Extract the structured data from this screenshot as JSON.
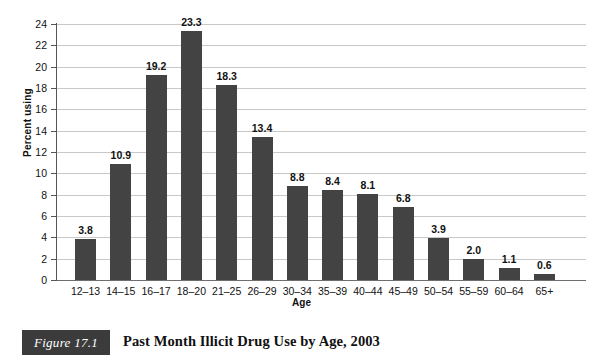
{
  "figure": {
    "badge_label": "Figure 17.1",
    "caption": "Past Month Illicit Drug Use by Age, 2003"
  },
  "chart_data": {
    "type": "bar",
    "title": "Past Month Illicit Drug Use by Age, 2003",
    "xlabel": "Age",
    "ylabel": "Percent using",
    "ylim": [
      0,
      24
    ],
    "ytick_step": 2,
    "grid": true,
    "legend": "none",
    "bar_color": "#434343",
    "gridline_color": "#c8c8c8",
    "axis_color": "#555555",
    "categories": [
      "12–13",
      "14–15",
      "16–17",
      "18–20",
      "21–25",
      "26–29",
      "30–34",
      "35–39",
      "40–44",
      "45–49",
      "50–54",
      "55–59",
      "60–64",
      "65+"
    ],
    "values": [
      3.8,
      10.9,
      19.2,
      23.3,
      18.3,
      13.4,
      8.8,
      8.4,
      8.1,
      6.8,
      3.9,
      2.0,
      1.1,
      0.6
    ],
    "value_labels": [
      "3.8",
      "10.9",
      "19.2",
      "23.3",
      "18.3",
      "13.4",
      "8.8",
      "8.4",
      "8.1",
      "6.8",
      "3.9",
      "2.0",
      "1.1",
      "0.6"
    ],
    "yticks": [
      0,
      2,
      4,
      6,
      8,
      10,
      12,
      14,
      16,
      18,
      20,
      22,
      24
    ],
    "ytick_labels": [
      "0",
      "2",
      "4",
      "6",
      "8",
      "10",
      "12",
      "14",
      "16",
      "18",
      "20",
      "22",
      "24"
    ]
  }
}
